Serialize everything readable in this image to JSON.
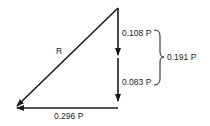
{
  "diagram": {
    "type": "force-vector-triangle",
    "resultant": {
      "label": "R"
    },
    "vectors": [
      {
        "id": "upper-vertical",
        "label": "0.108 P",
        "direction": "down"
      },
      {
        "id": "lower-vertical",
        "label": "0.083 P",
        "direction": "down"
      },
      {
        "id": "horizontal",
        "label": "0.296 P",
        "direction": "left"
      }
    ],
    "brace": {
      "label": "0.191 P",
      "groups": [
        "0.108 P",
        "0.083 P"
      ]
    },
    "colors": {
      "line": "#1a1a1a",
      "text": "#222222",
      "background": "#ffffff"
    }
  }
}
